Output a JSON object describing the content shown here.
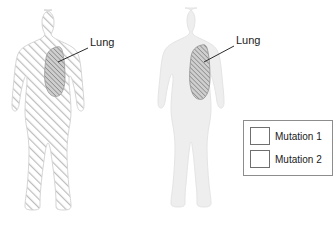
{
  "figure": {
    "title": "",
    "background_color": "#ffffff",
    "annotation_color": "#2b2b2b"
  },
  "subjects": [
    {
      "id": "left-body",
      "pose": "standing-legs-apart",
      "body_fill": "mutation-1-hatch",
      "body_color": "#d8d8d8",
      "organ": {
        "name": "Lung",
        "fill": "mutation-2-hatch",
        "color": "#8a8a8a"
      },
      "label": "Lung"
    },
    {
      "id": "right-body",
      "pose": "standing-legs-together",
      "body_fill": "solid",
      "body_color": "#eeeeee",
      "organ": {
        "name": "Lung",
        "fill": "mutation-2-hatch",
        "color": "#8a8a8a"
      },
      "label": "Lung"
    }
  ],
  "legend": {
    "border_color": "#8d8d8d",
    "items": [
      {
        "label": "Mutation 1",
        "pattern": "diagonal-hatch-sparse",
        "color": "#9a9a9a"
      },
      {
        "label": "Mutation 2",
        "pattern": "diagonal-hatch-dense",
        "color": "#7d7d7d"
      }
    ]
  }
}
